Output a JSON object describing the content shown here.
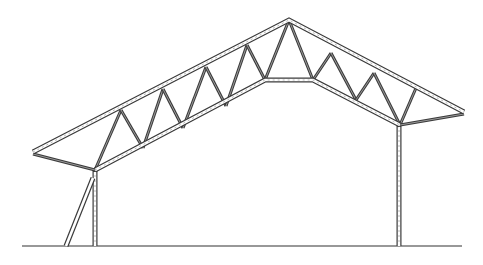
{
  "figure": {
    "caption": "",
    "colors": {
      "line": "#3a3a3a",
      "background": "#ffffff",
      "ground": "#333333"
    }
  },
  "geometry": {
    "apex": [
      289,
      20
    ],
    "left_eave": [
      33,
      152
    ],
    "right_eave": [
      464,
      112
    ],
    "left_column_top": [
      95,
      170
    ],
    "right_column_top": [
      400,
      125
    ],
    "bottom_chord_flat": [
      [
        265,
        80
      ],
      [
        313,
        80
      ]
    ],
    "ground_y": 246,
    "ground_x": [
      22,
      462
    ],
    "left_column_x": 95,
    "right_column_x": 399,
    "brace": [
      [
        66,
        246
      ],
      [
        93,
        178
      ]
    ]
  },
  "webs": {
    "left": [
      [
        [
          95,
          170
        ],
        [
          121,
          110
        ]
      ],
      [
        [
          121,
          110
        ],
        [
          143,
          148
        ]
      ],
      [
        [
          143,
          148
        ],
        [
          163,
          89
        ]
      ],
      [
        [
          163,
          89
        ],
        [
          183,
          128
        ]
      ],
      [
        [
          183,
          128
        ],
        [
          206,
          67
        ]
      ],
      [
        [
          206,
          67
        ],
        [
          226,
          106
        ]
      ],
      [
        [
          226,
          106
        ],
        [
          247,
          45
        ]
      ],
      [
        [
          247,
          45
        ],
        [
          265,
          80
        ]
      ]
    ],
    "right": [
      [
        [
          265,
          80
        ],
        [
          289,
          20
        ]
      ],
      [
        [
          289,
          20
        ],
        [
          313,
          80
        ]
      ],
      [
        [
          313,
          80
        ],
        [
          331,
          53
        ]
      ],
      [
        [
          331,
          53
        ],
        [
          356,
          100
        ]
      ],
      [
        [
          356,
          100
        ],
        [
          374,
          73
        ]
      ],
      [
        [
          374,
          73
        ],
        [
          400,
          125
        ]
      ],
      [
        [
          400,
          125
        ],
        [
          416,
          88
        ]
      ]
    ]
  }
}
